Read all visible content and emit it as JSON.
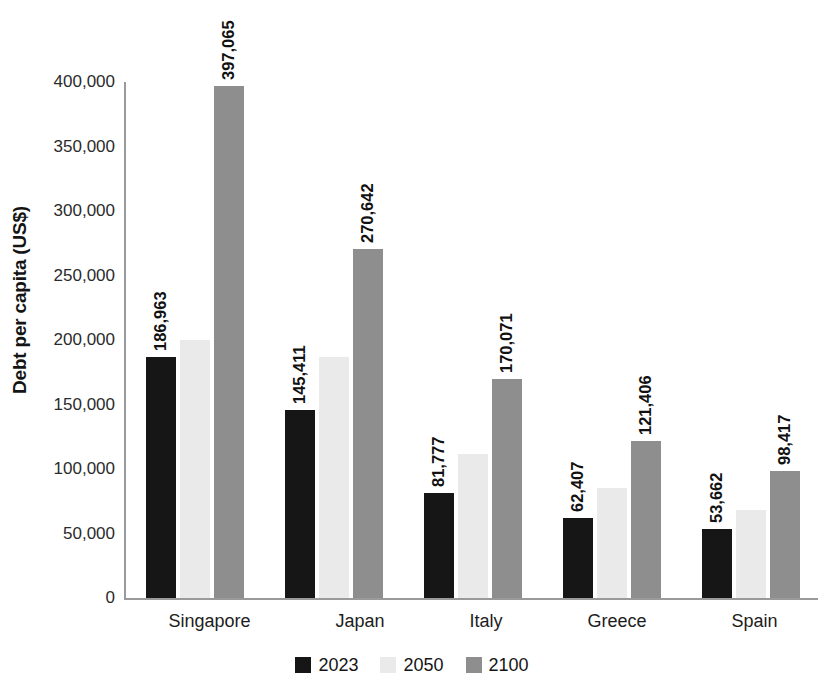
{
  "chart_data": {
    "type": "bar",
    "title": "",
    "xlabel": "",
    "ylabel": "Debt per capita (US$)",
    "ylim": [
      0,
      400000
    ],
    "y_ticks": [
      "0",
      "50,000",
      "100,000",
      "150,000",
      "200,000",
      "250,000",
      "300,000",
      "350,000",
      "400,000"
    ],
    "y_tick_values": [
      0,
      50000,
      100000,
      150000,
      200000,
      250000,
      300000,
      350000,
      400000
    ],
    "grid": false,
    "legend_position": "bottom",
    "categories": [
      "Singapore",
      "Japan",
      "Italy",
      "Greece",
      "Spain"
    ],
    "series": [
      {
        "name": "2023",
        "color": "#161616",
        "values": [
          186963,
          145411,
          81777,
          62407,
          53662
        ],
        "labels": [
          "186,963",
          "145,411",
          "81,777",
          "62,407",
          "53,662"
        ]
      },
      {
        "name": "2050",
        "color": "#eaeaea",
        "values": [
          200000,
          187000,
          112000,
          85000,
          68000
        ],
        "labels": [
          "",
          "",
          "",
          "",
          ""
        ]
      },
      {
        "name": "2100",
        "color": "#8e8e8e",
        "values": [
          397065,
          270642,
          170071,
          121406,
          98417
        ],
        "labels": [
          "397,065",
          "270,642",
          "170,071",
          "121,406",
          "98,417"
        ]
      }
    ]
  }
}
